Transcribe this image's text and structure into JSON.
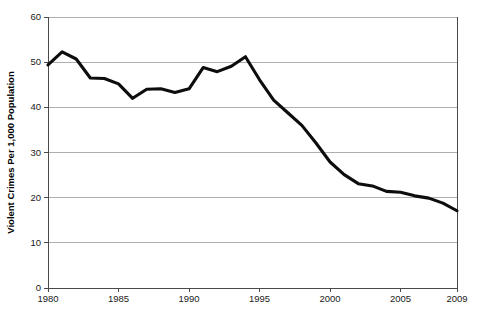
{
  "chart_data": {
    "type": "line",
    "title": "",
    "xlabel": "",
    "ylabel": "Violent Crimes Per 1,000 Population",
    "xlim": [
      1980,
      2009
    ],
    "ylim": [
      0,
      60
    ],
    "grid": true,
    "legend": "none",
    "line_color": "#0d0d0d",
    "grid_color": "#9a9a9a",
    "axis_color": "#4a4a4a",
    "background_color": "#ffffff",
    "y_ticks": [
      0,
      10,
      20,
      30,
      40,
      50,
      60
    ],
    "y_tick_labels": [
      "0",
      "10",
      "20",
      "30",
      "40",
      "50",
      "60"
    ],
    "x_ticks": [
      1980,
      1985,
      1990,
      1995,
      2000,
      2005,
      2009
    ],
    "x_tick_labels": [
      "1980",
      "1985",
      "1990",
      "1995",
      "2000",
      "2005",
      "2009"
    ],
    "x": [
      1980,
      1981,
      1982,
      1983,
      1984,
      1985,
      1986,
      1987,
      1988,
      1989,
      1990,
      1991,
      1992,
      1993,
      1994,
      1995,
      1996,
      1997,
      1998,
      1999,
      2000,
      2001,
      2002,
      2003,
      2004,
      2005,
      2006,
      2007,
      2008,
      2009
    ],
    "series": [
      {
        "name": "Violent Crimes Per 1,000 Population",
        "values": [
          49.4,
          52.3,
          50.7,
          46.5,
          46.4,
          45.2,
          42.0,
          44.0,
          44.1,
          43.3,
          44.1,
          48.8,
          47.9,
          49.1,
          51.2,
          46.1,
          41.6,
          38.8,
          36.0,
          32.1,
          27.9,
          25.1,
          23.1,
          22.6,
          21.4,
          21.2,
          20.4,
          19.9,
          18.8,
          17.1
        ]
      }
    ]
  },
  "plot_geometry": {
    "left": 48,
    "right": 457,
    "top": 17,
    "bottom": 288
  }
}
